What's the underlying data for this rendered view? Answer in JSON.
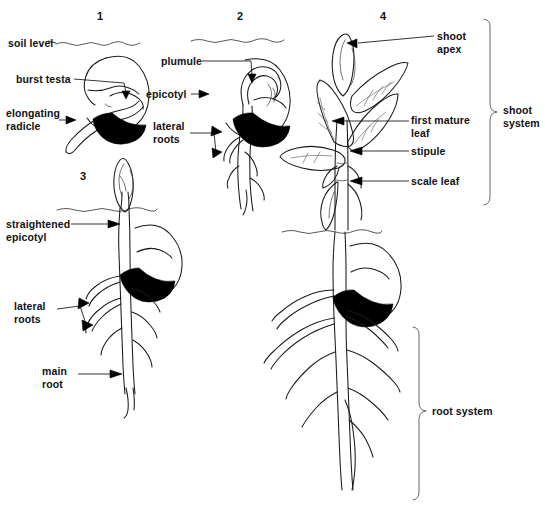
{
  "figure": {
    "background_color": "#ffffff",
    "ink_color": "#1a1a1a"
  },
  "stage_numbers": [
    {
      "label": "1",
      "x": 97,
      "y": 10
    },
    {
      "label": "2",
      "x": 237,
      "y": 10
    },
    {
      "label": "4",
      "x": 380,
      "y": 10
    },
    {
      "label": "3",
      "x": 80,
      "y": 170
    }
  ],
  "labels": [
    {
      "name": "soil-level",
      "text": "soil level",
      "x": 8,
      "y": 38,
      "align": "left"
    },
    {
      "name": "burst-testa",
      "text": "burst testa",
      "x": 16,
      "y": 74,
      "align": "left"
    },
    {
      "name": "elongating-radicle",
      "text": "elongating\nradicle",
      "x": 8,
      "y": 110,
      "align": "left"
    },
    {
      "name": "plumule",
      "text": "plumule",
      "x": 163,
      "y": 57,
      "align": "left"
    },
    {
      "name": "epicotyl",
      "text": "epicotyl",
      "x": 148,
      "y": 90,
      "align": "left"
    },
    {
      "name": "lateral-roots-2",
      "text": "lateral\nroots",
      "x": 155,
      "y": 122,
      "align": "left"
    },
    {
      "name": "shoot-apex",
      "text": "shoot\napex",
      "x": 437,
      "y": 30,
      "align": "left"
    },
    {
      "name": "first-mature-leaf",
      "text": "first mature\nleaf",
      "x": 412,
      "y": 116,
      "align": "left"
    },
    {
      "name": "stipule",
      "text": "stipule",
      "x": 412,
      "y": 146,
      "align": "left"
    },
    {
      "name": "scale-leaf",
      "text": "scale leaf",
      "x": 412,
      "y": 176,
      "align": "left"
    },
    {
      "name": "straightened-epicotyl",
      "text": "straightened\nepicotyl",
      "x": 8,
      "y": 222,
      "align": "left"
    },
    {
      "name": "lateral-roots-3",
      "text": "lateral\nroots",
      "x": 14,
      "y": 303,
      "align": "left"
    },
    {
      "name": "main-root",
      "text": "main\nroot",
      "x": 42,
      "y": 367,
      "align": "left"
    },
    {
      "name": "shoot-system",
      "text": "shoot\nsystem",
      "x": 503,
      "y": 104,
      "align": "left"
    },
    {
      "name": "root-system",
      "text": "root system",
      "x": 432,
      "y": 405,
      "align": "left"
    }
  ],
  "brackets": [
    {
      "name": "shoot-system-bracket",
      "x": 491,
      "y_top": 18,
      "y_bottom": 205,
      "tip_y": 112
    },
    {
      "name": "root-system-bracket",
      "x": 420,
      "y_top": 326,
      "y_bottom": 500,
      "tip_y": 411
    }
  ],
  "soil_lines": [
    {
      "name": "soil-line-stage-1",
      "x1": 56,
      "x2": 150,
      "y": 43
    },
    {
      "name": "soil-line-stage-2",
      "x1": 191,
      "x2": 300,
      "y": 40
    },
    {
      "name": "soil-line-stage-3",
      "x1": 57,
      "x2": 175,
      "y": 209
    },
    {
      "name": "soil-line-stage-4",
      "x1": 282,
      "x2": 400,
      "y": 231
    }
  ],
  "stages": [
    {
      "number": "1",
      "name": "stage-1-seed-with-radicle",
      "parts": [
        "burst testa",
        "elongating radicle",
        "seed coat",
        "cotyledon"
      ]
    },
    {
      "number": "2",
      "name": "stage-2-seedling-with-plumule",
      "parts": [
        "plumule",
        "epicotyl",
        "lateral roots",
        "main root",
        "seed"
      ]
    },
    {
      "number": "3",
      "name": "stage-3-seedling-straightened-epicotyl",
      "parts": [
        "straightened epicotyl",
        "lateral roots",
        "main root",
        "shoot tip",
        "seed"
      ]
    },
    {
      "number": "4",
      "name": "stage-4-young-plant",
      "parts": [
        "shoot apex",
        "first mature leaf",
        "stipule",
        "scale leaf",
        "root system",
        "seed"
      ]
    }
  ]
}
